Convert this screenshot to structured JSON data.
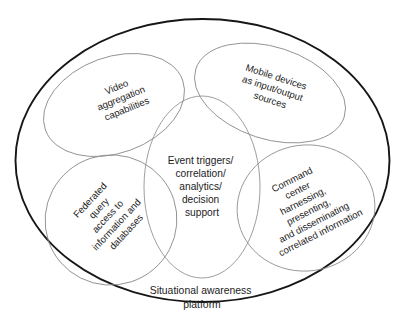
{
  "diagram": {
    "type": "venn-overlapping-ellipses",
    "container_label": {
      "name": "situational-awareness-platform",
      "lines": [
        "Situational awareness",
        "platform"
      ]
    },
    "sets": [
      {
        "id": "video-aggregation",
        "name": "video-aggregation-capabilities",
        "lines": [
          "Video",
          "aggregation",
          "capabilities"
        ],
        "rotation_deg": -22
      },
      {
        "id": "mobile-devices",
        "name": "mobile-devices-as-input-output-sources",
        "lines": [
          "Mobile devices",
          "as input/output",
          "sources"
        ],
        "rotation_deg": 18
      },
      {
        "id": "event-triggers",
        "name": "event-triggers-correlation-analytics-decision-support",
        "lines": [
          "Event triggers/",
          "correlation/",
          "analytics/",
          "decision",
          "support"
        ],
        "rotation_deg": 0
      },
      {
        "id": "federated-query",
        "name": "federated-query-access-to-information-and-databases",
        "lines": [
          "Federated",
          "query",
          "access to",
          "information and",
          "databases"
        ],
        "rotation_deg": -47
      },
      {
        "id": "command-center",
        "name": "command-center-harnessing-presenting-disseminating",
        "lines": [
          "Command",
          "center",
          "harnessing,",
          "presenting,",
          "and disseminating",
          "correlated information"
        ],
        "rotation_deg": -27
      }
    ],
    "colors": {
      "background": "#ffffff",
      "outer_stroke": "#161616",
      "set_stroke": "#8c8c8c",
      "text": "#1c1c1c"
    }
  }
}
